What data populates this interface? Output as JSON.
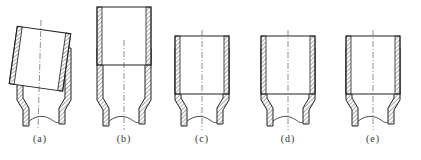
{
  "figure": {
    "panels": [
      {
        "id": "a",
        "label": "(a)",
        "state": "inner-tube-tilted",
        "cx": 40
      },
      {
        "id": "b",
        "label": "(b)",
        "state": "inner-tube-raised",
        "cx": 124
      },
      {
        "id": "c",
        "label": "(c)",
        "state": "inner-tube-seated",
        "cx": 202
      },
      {
        "id": "d",
        "label": "(d)",
        "state": "inner-tube-seated",
        "cx": 288
      },
      {
        "id": "e",
        "label": "(e)",
        "state": "inner-tube-seated",
        "cx": 373
      }
    ],
    "colors": {
      "line": "#222222",
      "hatch": "#555555",
      "background": "#ffffff"
    }
  }
}
